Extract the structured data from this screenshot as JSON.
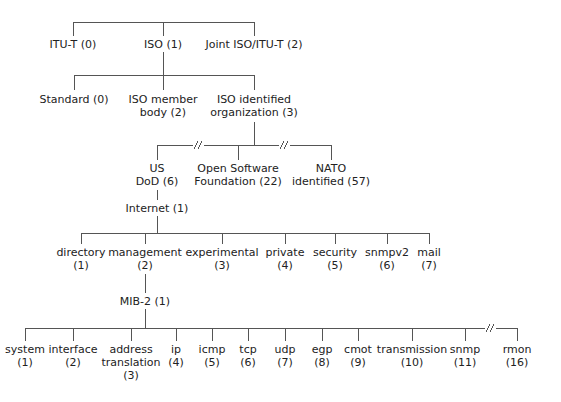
{
  "diagram": {
    "title": "",
    "line_color": "#555555",
    "root_children": [
      {
        "id": "itu-t",
        "lines": [
          "ITU-T (0)"
        ]
      },
      {
        "id": "iso",
        "lines": [
          "ISO (1)"
        ]
      },
      {
        "id": "joint",
        "lines": [
          "Joint ISO/ITU-T (2)"
        ]
      }
    ],
    "iso_children": [
      {
        "id": "standard",
        "lines": [
          "Standard (0)"
        ]
      },
      {
        "id": "iso-member-body",
        "lines": [
          "ISO member",
          "body (2)"
        ]
      },
      {
        "id": "iso-identified-org",
        "lines": [
          "ISO identified",
          "organization (3)"
        ]
      }
    ],
    "org_children": [
      {
        "id": "us-dod",
        "lines": [
          "US",
          "DoD (6)"
        ]
      },
      {
        "id": "osf",
        "lines": [
          "Open Software",
          "Foundation (22)"
        ]
      },
      {
        "id": "nato",
        "lines": [
          "NATO",
          "identified (57)"
        ]
      }
    ],
    "dod_child": {
      "id": "internet",
      "lines": [
        "Internet (1)"
      ]
    },
    "internet_children": [
      {
        "id": "directory",
        "lines": [
          "directory",
          "(1)"
        ]
      },
      {
        "id": "management",
        "lines": [
          "management",
          "(2)"
        ]
      },
      {
        "id": "experimental",
        "lines": [
          "experimental",
          "(3)"
        ]
      },
      {
        "id": "private",
        "lines": [
          "private",
          "(4)"
        ]
      },
      {
        "id": "security",
        "lines": [
          "security",
          "(5)"
        ]
      },
      {
        "id": "snmpv2",
        "lines": [
          "snmpv2",
          "(6)"
        ]
      },
      {
        "id": "mail",
        "lines": [
          "mail",
          "(7)"
        ]
      }
    ],
    "management_child": {
      "id": "mib-2",
      "lines": [
        "MIB-2 (1)"
      ]
    },
    "mib2_children": [
      {
        "id": "system",
        "lines": [
          "system",
          "(1)"
        ]
      },
      {
        "id": "interface",
        "lines": [
          "interface",
          "(2)"
        ]
      },
      {
        "id": "address-translation",
        "lines": [
          "address",
          "translation",
          "(3)"
        ]
      },
      {
        "id": "ip",
        "lines": [
          "ip",
          "(4)"
        ]
      },
      {
        "id": "icmp",
        "lines": [
          "icmp",
          "(5)"
        ]
      },
      {
        "id": "tcp",
        "lines": [
          "tcp",
          "(6)"
        ]
      },
      {
        "id": "udp",
        "lines": [
          "udp",
          "(7)"
        ]
      },
      {
        "id": "egp",
        "lines": [
          "egp",
          "(8)"
        ]
      },
      {
        "id": "cmot",
        "lines": [
          "cmot",
          "(9)"
        ]
      },
      {
        "id": "transmission",
        "lines": [
          "transmission",
          "(10)"
        ]
      },
      {
        "id": "snmp",
        "lines": [
          "snmp",
          "(11)"
        ]
      },
      {
        "id": "rmon",
        "lines": [
          "rmon",
          "(16)"
        ]
      }
    ],
    "break_marker": "//"
  }
}
